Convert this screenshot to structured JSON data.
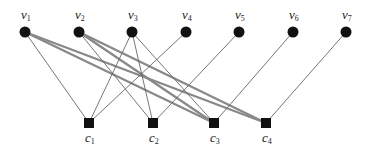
{
  "diagram": {
    "type": "bipartite-graph",
    "colors": {
      "node": "#111111",
      "thin_edge": "#666666",
      "thick_edge": "#888888",
      "label": "#222222"
    },
    "variable_nodes": [
      {
        "id": "v1",
        "base": "v",
        "sub": "1",
        "x": 25,
        "y": 32
      },
      {
        "id": "v2",
        "base": "v",
        "sub": "2",
        "x": 79,
        "y": 32
      },
      {
        "id": "v3",
        "base": "v",
        "sub": "3",
        "x": 132,
        "y": 32
      },
      {
        "id": "v4",
        "base": "v",
        "sub": "4",
        "x": 186,
        "y": 32
      },
      {
        "id": "v5",
        "base": "v",
        "sub": "5",
        "x": 239,
        "y": 32
      },
      {
        "id": "v6",
        "base": "v",
        "sub": "6",
        "x": 293,
        "y": 32
      },
      {
        "id": "v7",
        "base": "v",
        "sub": "7",
        "x": 346,
        "y": 32
      }
    ],
    "check_nodes": [
      {
        "id": "c1",
        "base": "c",
        "sub": "1",
        "x": 89,
        "y": 123
      },
      {
        "id": "c2",
        "base": "c",
        "sub": "2",
        "x": 153,
        "y": 123
      },
      {
        "id": "c3",
        "base": "c",
        "sub": "3",
        "x": 214,
        "y": 123
      },
      {
        "id": "c4",
        "base": "c",
        "sub": "4",
        "x": 266,
        "y": 123
      }
    ],
    "edges": [
      {
        "from": "v1",
        "to": "c1",
        "weight": "thin"
      },
      {
        "from": "v1",
        "to": "c3",
        "weight": "thick"
      },
      {
        "from": "v1",
        "to": "c4",
        "weight": "thick"
      },
      {
        "from": "v2",
        "to": "c2",
        "weight": "thin"
      },
      {
        "from": "v2",
        "to": "c3",
        "weight": "thick"
      },
      {
        "from": "v2",
        "to": "c4",
        "weight": "thick"
      },
      {
        "from": "v3",
        "to": "c1",
        "weight": "thin"
      },
      {
        "from": "v3",
        "to": "c2",
        "weight": "thin"
      },
      {
        "from": "v3",
        "to": "c3",
        "weight": "thin"
      },
      {
        "from": "v4",
        "to": "c1",
        "weight": "thin"
      },
      {
        "from": "v5",
        "to": "c2",
        "weight": "thin"
      },
      {
        "from": "v6",
        "to": "c3",
        "weight": "thin"
      },
      {
        "from": "v7",
        "to": "c4",
        "weight": "thin"
      }
    ]
  }
}
